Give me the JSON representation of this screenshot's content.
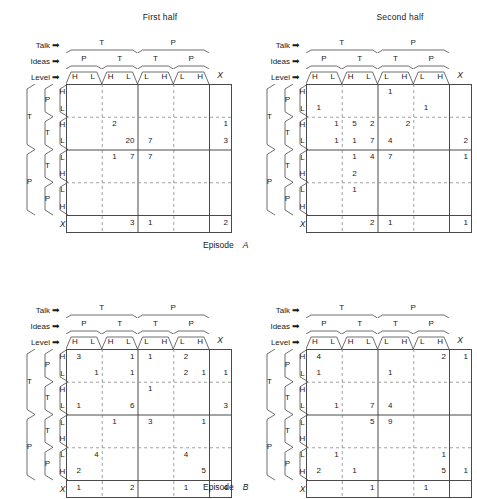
{
  "figure": {
    "episodes": [
      {
        "caption": "Episode",
        "letter": "A"
      },
      {
        "caption": "Episode",
        "letter": "B"
      }
    ]
  },
  "axis_labels": {
    "talk": "Talk",
    "ideas": "Ideas",
    "level": "Level",
    "arrow": "➡"
  },
  "headers": {
    "talk": [
      "T",
      "P"
    ],
    "ideas": [
      "P",
      "T",
      "T",
      "P"
    ],
    "level": [
      "H",
      "L",
      "H",
      "L",
      "L",
      "H",
      "L",
      "H"
    ],
    "extra_column": "X"
  },
  "row_headers": {
    "outer": [
      "T",
      "P"
    ],
    "middle": [
      "P",
      "T",
      "T",
      "P"
    ],
    "level": [
      "H",
      "L",
      "H",
      "L",
      "L",
      "H",
      "L",
      "H"
    ],
    "extra_row": "X"
  },
  "panels": [
    {
      "id": "episode-a-first-half",
      "title": "First half",
      "chart_data": {
        "type": "heatmap",
        "title": "First half",
        "xlabel": "Talk / Ideas / Level",
        "ylabel": "Talk / Ideas / Level",
        "columns": [
          "T-P-H",
          "T-P-L",
          "T-T-H",
          "T-T-L",
          "P-T-L",
          "P-T-H",
          "P-P-L",
          "P-P-H",
          "X"
        ],
        "rows": [
          "T-P-H",
          "T-P-L",
          "T-T-H",
          "T-T-L",
          "P-T-L",
          "P-T-H",
          "P-P-L",
          "P-P-H",
          "X"
        ],
        "values": [
          [
            null,
            null,
            null,
            null,
            null,
            null,
            null,
            null,
            null
          ],
          [
            null,
            null,
            null,
            null,
            null,
            null,
            null,
            null,
            null
          ],
          [
            null,
            null,
            2,
            null,
            null,
            null,
            null,
            null,
            1
          ],
          [
            null,
            null,
            null,
            20,
            7,
            null,
            null,
            null,
            3
          ],
          [
            null,
            null,
            1,
            7,
            7,
            null,
            null,
            null,
            null
          ],
          [
            null,
            null,
            null,
            null,
            null,
            null,
            null,
            null,
            null
          ],
          [
            null,
            null,
            null,
            null,
            null,
            null,
            null,
            null,
            null
          ],
          [
            null,
            null,
            null,
            null,
            null,
            null,
            null,
            null,
            null
          ],
          [
            null,
            null,
            null,
            3,
            1,
            null,
            null,
            null,
            2
          ]
        ]
      }
    },
    {
      "id": "episode-a-second-half",
      "title": "Second half",
      "chart_data": {
        "type": "heatmap",
        "title": "Second half",
        "xlabel": "Talk / Ideas / Level",
        "ylabel": "Talk / Ideas / Level",
        "columns": [
          "T-P-H",
          "T-P-L",
          "T-T-H",
          "T-T-L",
          "P-T-L",
          "P-T-H",
          "P-P-L",
          "P-P-H",
          "X"
        ],
        "rows": [
          "T-P-H",
          "T-P-L",
          "T-T-H",
          "T-T-L",
          "P-T-L",
          "P-T-H",
          "P-P-L",
          "P-P-H",
          "X"
        ],
        "values": [
          [
            null,
            null,
            null,
            null,
            1,
            null,
            null,
            null,
            null
          ],
          [
            1,
            null,
            null,
            null,
            null,
            null,
            1,
            null,
            null
          ],
          [
            null,
            1,
            5,
            2,
            null,
            2,
            null,
            null,
            null
          ],
          [
            null,
            1,
            1,
            7,
            4,
            null,
            null,
            null,
            2
          ],
          [
            null,
            null,
            1,
            4,
            7,
            null,
            null,
            null,
            1
          ],
          [
            null,
            null,
            2,
            null,
            null,
            null,
            null,
            null,
            null
          ],
          [
            null,
            null,
            1,
            null,
            null,
            null,
            null,
            null,
            null
          ],
          [
            null,
            null,
            null,
            null,
            null,
            null,
            null,
            null,
            null
          ],
          [
            null,
            null,
            null,
            2,
            1,
            null,
            null,
            null,
            1
          ]
        ]
      }
    },
    {
      "id": "episode-b-first-half",
      "title": "",
      "chart_data": {
        "type": "heatmap",
        "title": "",
        "xlabel": "Talk / Ideas / Level",
        "ylabel": "Talk / Ideas / Level",
        "columns": [
          "T-P-H",
          "T-P-L",
          "T-T-H",
          "T-T-L",
          "P-T-L",
          "P-T-H",
          "P-P-L",
          "P-P-H",
          "X"
        ],
        "rows": [
          "T-P-H",
          "T-P-L",
          "T-T-H",
          "T-T-L",
          "P-T-L",
          "P-T-H",
          "P-P-L",
          "P-P-H",
          "X"
        ],
        "values": [
          [
            3,
            null,
            null,
            1,
            1,
            null,
            2,
            null,
            null
          ],
          [
            null,
            1,
            null,
            1,
            null,
            null,
            2,
            1,
            1
          ],
          [
            null,
            null,
            null,
            null,
            1,
            null,
            null,
            null,
            null
          ],
          [
            1,
            null,
            null,
            6,
            null,
            null,
            null,
            null,
            3
          ],
          [
            null,
            null,
            1,
            null,
            3,
            null,
            null,
            1,
            null
          ],
          [
            null,
            null,
            null,
            null,
            null,
            null,
            null,
            null,
            null
          ],
          [
            null,
            4,
            null,
            null,
            null,
            null,
            4,
            null,
            null
          ],
          [
            2,
            null,
            null,
            null,
            null,
            null,
            null,
            5,
            null
          ],
          [
            1,
            null,
            null,
            2,
            null,
            null,
            1,
            null,
            4
          ]
        ]
      }
    },
    {
      "id": "episode-b-second-half",
      "title": "",
      "chart_data": {
        "type": "heatmap",
        "title": "",
        "xlabel": "Talk / Ideas / Level",
        "ylabel": "Talk / Ideas / Level",
        "columns": [
          "T-P-H",
          "T-P-L",
          "T-T-H",
          "T-T-L",
          "P-T-L",
          "P-T-H",
          "P-P-L",
          "P-P-H",
          "X"
        ],
        "rows": [
          "T-P-H",
          "T-P-L",
          "T-T-H",
          "T-T-L",
          "P-T-L",
          "P-T-H",
          "P-P-L",
          "P-P-H",
          "X"
        ],
        "values": [
          [
            4,
            null,
            null,
            null,
            null,
            null,
            null,
            2,
            1
          ],
          [
            1,
            null,
            null,
            null,
            1,
            null,
            null,
            null,
            null
          ],
          [
            null,
            null,
            null,
            null,
            null,
            null,
            null,
            null,
            null
          ],
          [
            null,
            1,
            null,
            7,
            4,
            null,
            null,
            null,
            null
          ],
          [
            null,
            null,
            null,
            5,
            9,
            null,
            null,
            null,
            null
          ],
          [
            null,
            null,
            null,
            null,
            null,
            null,
            null,
            null,
            null
          ],
          [
            null,
            1,
            null,
            null,
            null,
            null,
            null,
            1,
            null
          ],
          [
            2,
            null,
            1,
            null,
            null,
            null,
            null,
            5,
            1
          ],
          [
            null,
            null,
            null,
            1,
            null,
            null,
            1,
            null,
            null
          ]
        ]
      }
    }
  ]
}
